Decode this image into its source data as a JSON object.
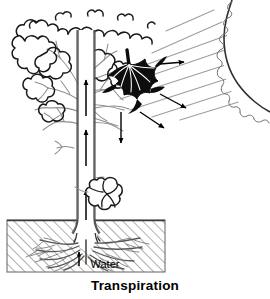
{
  "figure": {
    "caption": "Transpiration",
    "labels": {
      "water": "Water"
    },
    "colors": {
      "ink": "#000000",
      "gray_line": "#8a8a8a",
      "light_gray": "#b0b0b0",
      "leaf_fill": "#0d0d0d",
      "soil_hatch": "#9a9a9a",
      "background": "#ffffff"
    },
    "elements": {
      "sun": "sun-top-right-corner",
      "sun_rays": "diagonal-gray-rays",
      "tree": "deciduous-tree-with-cloud-canopy",
      "trunk": "vertical-water-conducting-trunk",
      "trunk_flow_arrows": "upward-water-flow-arrows",
      "highlighted_leaf": "black-maple-leaf",
      "vapor_arrows": "water-vapor-release-arrows",
      "vapor_cloud": "water-vapor-puff",
      "soil": "hatched-soil-block",
      "roots": "root-system",
      "uptake_arrow": "water-uptake-arrow"
    }
  }
}
